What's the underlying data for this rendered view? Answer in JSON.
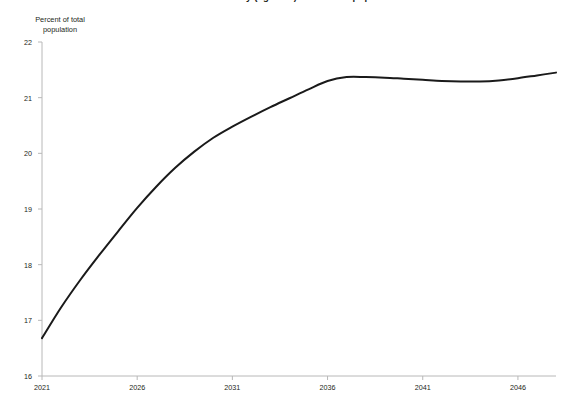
{
  "chart_data": {
    "type": "line",
    "title": "Share of the elderly (age 65+) in the total population",
    "title_clipped": true,
    "ylabel": "Percent of total\npopulation",
    "ylabel_lines": [
      "Percent of total",
      "population"
    ],
    "xlabel": "",
    "ylim": [
      16,
      22
    ],
    "xlim": [
      2021,
      2048
    ],
    "yticks": [
      16,
      17,
      18,
      19,
      20,
      21,
      22
    ],
    "ytick_labels": [
      "16",
      "17",
      "18",
      "19",
      "20",
      "21",
      "22"
    ],
    "xticks": [
      2021,
      2026,
      2031,
      2036,
      2041,
      2046
    ],
    "xtick_labels": [
      "2021",
      "2026",
      "2031",
      "2036",
      "2041",
      "2046"
    ],
    "grid": false,
    "legend": false,
    "line_color": "#1a1a1a",
    "line_width": 2.0,
    "axis_color": "#b8b8b8",
    "background_color": "#ffffff",
    "x": [
      2021,
      2022,
      2023,
      2024,
      2025,
      2026,
      2027,
      2028,
      2029,
      2030,
      2031,
      2032,
      2033,
      2034,
      2035,
      2036,
      2037,
      2038,
      2039,
      2040,
      2041,
      2042,
      2043,
      2044,
      2045,
      2046,
      2047,
      2048
    ],
    "values": [
      16.68,
      17.23,
      17.72,
      18.17,
      18.6,
      19.02,
      19.4,
      19.74,
      20.03,
      20.28,
      20.48,
      20.66,
      20.83,
      20.99,
      21.15,
      21.3,
      21.37,
      21.37,
      21.36,
      21.34,
      21.32,
      21.3,
      21.29,
      21.29,
      21.31,
      21.35,
      21.4,
      21.45
    ],
    "series": [
      {
        "name": "Percent of total population",
        "values": [
          16.68,
          17.23,
          17.72,
          18.17,
          18.6,
          19.02,
          19.4,
          19.74,
          20.03,
          20.28,
          20.48,
          20.66,
          20.83,
          20.99,
          21.15,
          21.3,
          21.37,
          21.37,
          21.36,
          21.34,
          21.32,
          21.3,
          21.29,
          21.29,
          21.31,
          21.35,
          21.4,
          21.45
        ]
      }
    ]
  }
}
